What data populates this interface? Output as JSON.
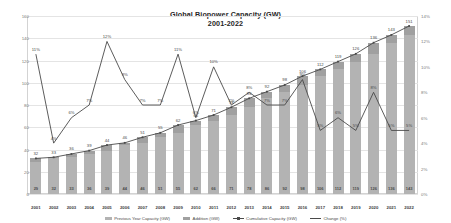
{
  "chart_data": {
    "type": "bar",
    "title": "Global Biopower Capacity (GW)",
    "subtitle": "2001-2022",
    "xlabel": "",
    "ylabel": "",
    "grid": true,
    "legend_position": "bottom",
    "categories": [
      "2001",
      "2002",
      "2003",
      "2004",
      "2005",
      "2006",
      "2007",
      "2008",
      "2009",
      "2010",
      "2011",
      "2012",
      "2013",
      "2014",
      "2015",
      "2016",
      "2017",
      "2018",
      "2019",
      "2020",
      "2021",
      "2022"
    ],
    "ylim": [
      0,
      160
    ],
    "yticks": [
      "0",
      "20",
      "40",
      "60",
      "80",
      "100",
      "120",
      "140",
      "160"
    ],
    "y2lim": [
      0,
      14
    ],
    "y2ticks": [
      "0%",
      "2%",
      "4%",
      "6%",
      "8%",
      "10%",
      "12%",
      "14%"
    ],
    "series": [
      {
        "name": "Previous Year Capacity (GW)",
        "type": "bar-stacked",
        "color": "#b3b3b3",
        "values": [
          29,
          32,
          33,
          36,
          39,
          44,
          46,
          51,
          55,
          62,
          66,
          71,
          78,
          86,
          92,
          98,
          106,
          112,
          119,
          126,
          136,
          143
        ]
      },
      {
        "name": "Addition (GW)",
        "type": "bar-stacked",
        "color": "#a0a0a0",
        "values": [
          3,
          1,
          3,
          3,
          5,
          2,
          5,
          4,
          7,
          4,
          5,
          7,
          8,
          6,
          6,
          8,
          6,
          7,
          7,
          10,
          7,
          8
        ]
      },
      {
        "name": "Cumulative Capacity (GW)",
        "type": "line",
        "color": "#4a4a4a",
        "values": [
          32,
          33,
          36,
          39,
          44,
          46,
          51,
          55,
          62,
          66,
          71,
          78,
          86,
          92,
          98,
          106,
          112,
          119,
          126,
          136,
          143,
          151
        ]
      },
      {
        "name": "Change (%)",
        "type": "line",
        "color": "#4a4a4a",
        "axis": "secondary",
        "values": [
          11,
          4,
          6,
          7,
          12,
          9,
          7,
          7,
          11,
          6,
          10,
          7,
          8,
          7,
          7,
          9,
          5,
          6,
          5,
          8,
          5,
          5
        ],
        "labels": [
          "11%",
          "4%",
          "6%",
          "7%",
          "12%",
          "9%",
          "7%",
          "7%",
          "11%",
          "6%",
          "10%",
          "7%",
          "8%",
          "7%",
          "7%",
          "9%",
          "5%",
          "6%",
          "5%",
          "8%",
          "5%",
          "5%"
        ]
      }
    ]
  },
  "legend": {
    "items": [
      {
        "label": "Previous Year Capacity (GW)",
        "marker": "box",
        "color": "#b3b3b3"
      },
      {
        "label": "Addition (GW)",
        "marker": "box",
        "color": "#a0a0a0"
      },
      {
        "label": "Cumulative Capacity (GW)",
        "marker": "line-marker",
        "color": "#4a4a4a"
      },
      {
        "label": "Change (%)",
        "marker": "line",
        "color": "#4a4a4a"
      }
    ]
  }
}
